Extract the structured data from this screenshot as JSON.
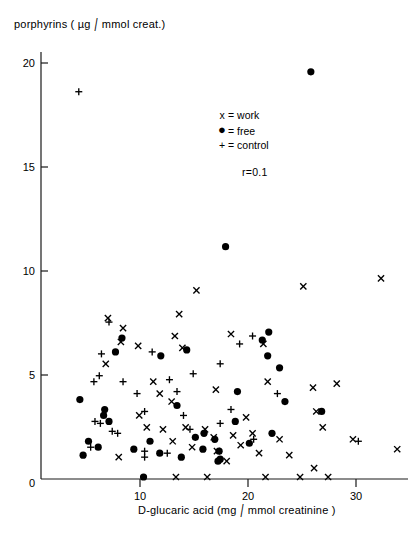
{
  "figure": {
    "axis_color": "#1a1a1a",
    "marker_color": "#000000",
    "background": "#ffffff",
    "ylabel": "porphyrins ( µg / mmol creat.)",
    "ylabel_pre": "porphyrins ( µg",
    "ylabel_post": "mmol creat.)",
    "xlabel": "D-glucaric acid (mg / mmol creatinine)",
    "xlabel_pre": "D-glucaric acid  (mg",
    "xlabel_post": "mmol creatinine )",
    "slash": "/",
    "r_label": "r=0.1"
  },
  "legend": {
    "position": "upper-center-right",
    "items": [
      {
        "symbol": "x",
        "sep": "=",
        "label": "work"
      },
      {
        "symbol": "●",
        "sep": "=",
        "label": "free"
      },
      {
        "symbol": "+",
        "sep": "=",
        "label": "control"
      }
    ],
    "row0_symbol": "x",
    "row0_label": "= work",
    "row1_symbol": "●",
    "row1_label": "= free",
    "row2_symbol": "+",
    "row2_label": "= control"
  },
  "chart_data": {
    "type": "scatter",
    "title": "",
    "xlabel": "D-glucaric acid (mg/mmol creatinine)",
    "ylabel": "porphyrins (µg/mmol creat.)",
    "xlim": [
      0,
      34
    ],
    "ylim": [
      0,
      21.5
    ],
    "xticks": [
      0,
      10,
      20,
      30
    ],
    "yticks": [
      0,
      5,
      10,
      15,
      20
    ],
    "xtick_labels": [
      "0",
      "10",
      "20",
      "30"
    ],
    "ytick_labels": [
      "0",
      "5",
      "10",
      "15",
      "20"
    ],
    "grid": false,
    "annotations": [
      {
        "text": "r=0.1",
        "x": 21.5,
        "y": 15.0
      }
    ],
    "series": [
      {
        "name": "work",
        "marker": "x",
        "color": "#000000",
        "points": [
          [
            6.2,
            8.1
          ],
          [
            7.6,
            7.6
          ],
          [
            7.4,
            6.9
          ],
          [
            9.0,
            6.7
          ],
          [
            12.8,
            8.3
          ],
          [
            12.4,
            7.2
          ],
          [
            13.1,
            6.6
          ],
          [
            14.4,
            9.5
          ],
          [
            17.6,
            7.3
          ],
          [
            20.6,
            6.8
          ],
          [
            24.3,
            9.7
          ],
          [
            31.5,
            10.1
          ],
          [
            6.0,
            5.8
          ],
          [
            10.4,
            4.9
          ],
          [
            11.0,
            4.3
          ],
          [
            12.1,
            3.9
          ],
          [
            21.0,
            4.9
          ],
          [
            25.2,
            4.6
          ],
          [
            16.2,
            4.5
          ],
          [
            9.1,
            3.2
          ],
          [
            9.8,
            2.6
          ],
          [
            11.3,
            2.5
          ],
          [
            13.4,
            2.6
          ],
          [
            12.2,
            1.9
          ],
          [
            14.0,
            1.6
          ],
          [
            15.2,
            2.5
          ],
          [
            16.0,
            2.1
          ],
          [
            16.3,
            1.4
          ],
          [
            17.8,
            2.2
          ],
          [
            18.5,
            1.7
          ],
          [
            19.0,
            3.1
          ],
          [
            19.6,
            2.3
          ],
          [
            20.2,
            1.3
          ],
          [
            22.1,
            2.0
          ],
          [
            23.0,
            1.2
          ],
          [
            25.5,
            3.4
          ],
          [
            26.1,
            2.6
          ],
          [
            27.4,
            4.8
          ],
          [
            28.9,
            2.0
          ],
          [
            33.0,
            1.5
          ],
          [
            12.5,
            0.1
          ],
          [
            15.4,
            0.1
          ],
          [
            20.8,
            0.1
          ],
          [
            24.0,
            0.1
          ],
          [
            25.3,
            0.55
          ],
          [
            26.6,
            0.1
          ],
          [
            17.2,
            0.9
          ],
          [
            7.2,
            1.1
          ]
        ]
      },
      {
        "name": "free",
        "marker": "o",
        "color": "#000000",
        "points": [
          [
            25.0,
            20.5
          ],
          [
            17.1,
            11.7
          ],
          [
            7.5,
            7.1
          ],
          [
            6.9,
            6.4
          ],
          [
            11.1,
            6.2
          ],
          [
            13.5,
            6.5
          ],
          [
            20.5,
            7.0
          ],
          [
            21.1,
            7.4
          ],
          [
            21.0,
            6.2
          ],
          [
            22.1,
            5.6
          ],
          [
            26.0,
            3.4
          ],
          [
            3.6,
            4.0
          ],
          [
            5.9,
            3.5
          ],
          [
            5.8,
            3.2
          ],
          [
            6.3,
            2.9
          ],
          [
            12.6,
            3.7
          ],
          [
            14.3,
            2.1
          ],
          [
            15.1,
            2.3
          ],
          [
            16.1,
            2.0
          ],
          [
            18.0,
            2.9
          ],
          [
            21.4,
            2.3
          ],
          [
            4.4,
            1.9
          ],
          [
            5.3,
            1.6
          ],
          [
            8.6,
            1.5
          ],
          [
            10.1,
            1.9
          ],
          [
            11.0,
            1.3
          ],
          [
            13.0,
            1.1
          ],
          [
            15.0,
            1.5
          ],
          [
            16.5,
            1.4
          ],
          [
            16.6,
            1.0
          ],
          [
            19.3,
            1.8
          ],
          [
            22.6,
            3.9
          ],
          [
            9.5,
            0.1
          ],
          [
            3.9,
            1.2
          ],
          [
            16.4,
            0.9
          ],
          [
            18.2,
            4.4
          ]
        ]
      },
      {
        "name": "control",
        "marker": "+",
        "color": "#000000",
        "points": [
          [
            3.5,
            19.5
          ],
          [
            6.3,
            7.9
          ],
          [
            10.3,
            6.4
          ],
          [
            18.4,
            6.8
          ],
          [
            19.6,
            7.2
          ],
          [
            16.6,
            5.8
          ],
          [
            5.6,
            6.3
          ],
          [
            5.4,
            5.2
          ],
          [
            4.9,
            4.9
          ],
          [
            7.6,
            4.9
          ],
          [
            8.9,
            4.3
          ],
          [
            11.9,
            5.0
          ],
          [
            12.6,
            4.4
          ],
          [
            14.1,
            5.3
          ],
          [
            21.9,
            4.3
          ],
          [
            13.2,
            3.2
          ],
          [
            5.0,
            2.9
          ],
          [
            5.5,
            2.8
          ],
          [
            6.6,
            2.4
          ],
          [
            7.1,
            2.3
          ],
          [
            9.6,
            3.4
          ],
          [
            9.6,
            1.4
          ],
          [
            9.6,
            1.1
          ],
          [
            16.6,
            2.8
          ],
          [
            17.6,
            3.5
          ],
          [
            19.7,
            2.0
          ],
          [
            29.4,
            1.9
          ],
          [
            13.8,
            2.5
          ],
          [
            4.6,
            1.6
          ],
          [
            11.7,
            1.3
          ]
        ]
      }
    ]
  },
  "axes": {
    "y_tick_labels": [
      "20",
      "15",
      "10",
      "5",
      "0"
    ],
    "x_tick_labels": [
      "0",
      "10",
      "20",
      "30"
    ]
  }
}
